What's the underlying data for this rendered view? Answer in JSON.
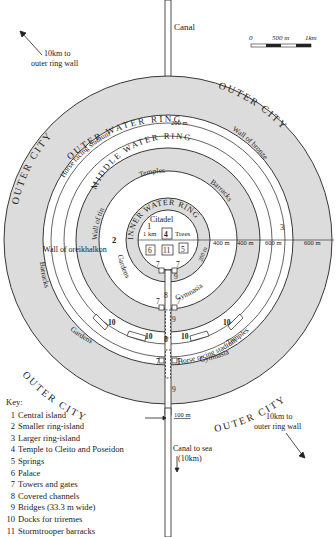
{
  "diagram": {
    "title_labels": {
      "canal_top": "Canal",
      "canal_sea": "Canal to sea",
      "canal_sea_dist": "(10km)",
      "outer_wall_nw_1": "10km to",
      "outer_wall_nw_2": "outer ring wall",
      "outer_wall_se_1": "10km to",
      "outer_wall_se_2": "outer ring wall",
      "width_100m": "100 m"
    },
    "scale_bar": {
      "labels": [
        "0",
        "500 m",
        "1km"
      ]
    },
    "rings": {
      "outer_city": "OUTER CITY",
      "outer_water_ring": "OUTER WATER RING",
      "middle_water_ring": "MIDDLE WATER RING",
      "inner_water_ring": "INNER WATER RING"
    },
    "features": {
      "horse_stadium_top": "Horse racing stadium",
      "stadium_width": "200 m",
      "wall_of_bronze": "Wall of bronze",
      "wall_of_tin": "Wall of tin",
      "temples_inner": "Temples",
      "barracks_inner": "Barracks",
      "citadel": "Citadel",
      "trees": "Trees",
      "wall_of_oreikhalkon": "Wall of oreikhalkon",
      "gardens_inner": "Gardens",
      "gymnasia_inner": "Gymnasia",
      "barracks_outer": "Barracks",
      "gardens_outer": "Gardens",
      "horse_stadium_bottom": "Horse racing stadium",
      "gymnasia_outer": "Gymnasia",
      "temples_outer": "Temples",
      "width_1km": "1 km",
      "width_200m_inner": "200 m"
    },
    "dimensions": [
      "400 m",
      "400 m",
      "600 m",
      "600 m"
    ],
    "numbers": {
      "n1": "1",
      "n2": "2",
      "n3": "3",
      "n4": "4",
      "n5": "5",
      "n6": "6",
      "n7": "7",
      "n8": "8",
      "n9": "9",
      "n10": "10",
      "n11": "11"
    },
    "colors": {
      "water": "#dcdcdc",
      "land": "#ffffff",
      "line": "#222222"
    }
  },
  "key": {
    "title": "Key:",
    "items": [
      {
        "num": "1",
        "label": "Central island"
      },
      {
        "num": "2",
        "label": "Smaller ring-island"
      },
      {
        "num": "3",
        "label": "Larger ring-island"
      },
      {
        "num": "4",
        "label": "Temple to Cleito and Poseidon"
      },
      {
        "num": "5",
        "label": "Springs"
      },
      {
        "num": "6",
        "label": "Palace"
      },
      {
        "num": "7",
        "label": "Towers and gates"
      },
      {
        "num": "8",
        "label": "Covered channels"
      },
      {
        "num": "9",
        "label": "Bridges (33.3 m wide)"
      },
      {
        "num": "10",
        "label": "Docks for triremes"
      },
      {
        "num": "11",
        "label": "Stormtrooper barracks"
      }
    ]
  }
}
